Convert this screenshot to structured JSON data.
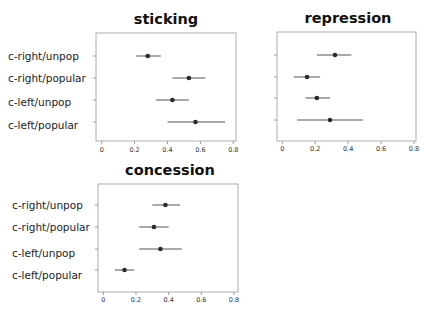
{
  "chart_data": [
    {
      "type": "scatter",
      "subtype": "forest-plot (point estimate with horizontal interval)",
      "title": "sticking",
      "categories": [
        "c-right/unpop",
        "c-right/popular",
        "c-left/unpop",
        "c-left/popular"
      ],
      "values": [
        0.28,
        0.53,
        0.43,
        0.57
      ],
      "ci_low": [
        0.21,
        0.43,
        0.33,
        0.4
      ],
      "ci_high": [
        0.36,
        0.63,
        0.53,
        0.75
      ],
      "xlim": [
        0,
        0.8
      ],
      "xticks": [
        "0",
        "0.2",
        "0.4",
        "0.6",
        "0.8"
      ],
      "show_row_labels": true,
      "xlabel": "",
      "ylabel": "",
      "grid": false
    },
    {
      "type": "scatter",
      "subtype": "forest-plot (point estimate with horizontal interval)",
      "title": "repression",
      "categories": [
        "c-right/unpop",
        "c-right/popular",
        "c-left/unpop",
        "c-left/popular"
      ],
      "values": [
        0.32,
        0.15,
        0.21,
        0.29
      ],
      "ci_low": [
        0.21,
        0.07,
        0.14,
        0.09
      ],
      "ci_high": [
        0.42,
        0.23,
        0.29,
        0.49
      ],
      "xlim": [
        0,
        0.8
      ],
      "xticks": [
        "0",
        "0.2",
        "0.4",
        "0.6",
        "0.8"
      ],
      "show_row_labels": false,
      "xlabel": "",
      "ylabel": "",
      "grid": false
    },
    {
      "type": "scatter",
      "subtype": "forest-plot (point estimate with horizontal interval)",
      "title": "concession",
      "categories": [
        "c-right/unpop",
        "c-right/popular",
        "c-left/unpop",
        "c-left/popular"
      ],
      "values": [
        0.38,
        0.31,
        0.35,
        0.13
      ],
      "ci_low": [
        0.3,
        0.22,
        0.22,
        0.07
      ],
      "ci_high": [
        0.47,
        0.4,
        0.48,
        0.19
      ],
      "xlim": [
        0,
        0.8
      ],
      "xticks": [
        "0",
        "0.2",
        "0.4",
        "0.6",
        "0.8"
      ],
      "show_row_labels": true,
      "xlabel": "",
      "ylabel": "",
      "grid": false
    }
  ],
  "colors": {
    "frame": "#9a9a9a",
    "point": "#2a2a2a",
    "interval": "#555555",
    "text": "#111111"
  }
}
